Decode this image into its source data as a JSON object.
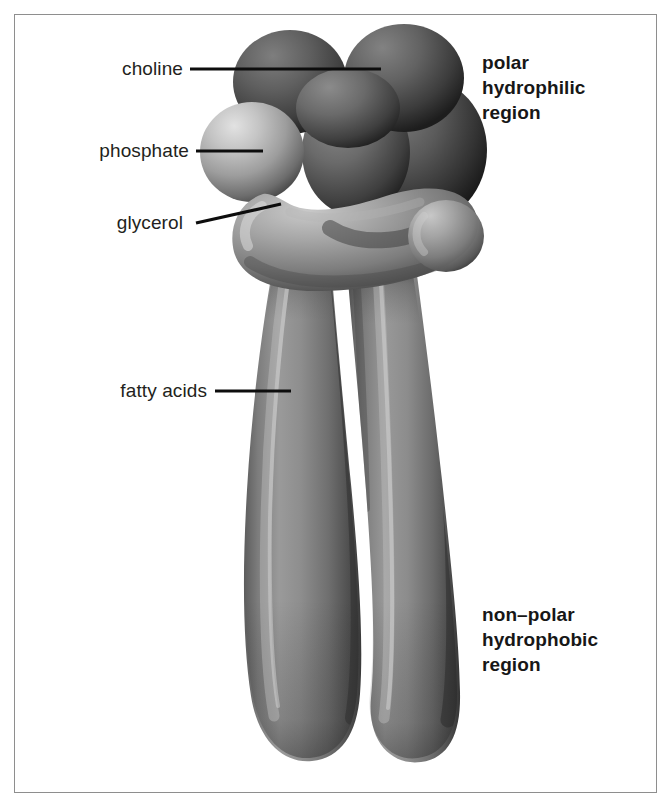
{
  "figure": {
    "background_color": "#ffffff",
    "frame_color": "#8e8e8e",
    "leader_line_color": "#0d0d0d"
  },
  "labels": {
    "choline": "choline",
    "phosphate": "phosphate",
    "glycerol": "glycerol",
    "fatty_acids": "fatty acids"
  },
  "regions": {
    "polar": {
      "line1": "polar",
      "line2": "hydrophilic",
      "line3": "region"
    },
    "nonpolar": {
      "line1": "non–polar",
      "line2": "hydrophobic",
      "line3": "region"
    }
  },
  "molecule": {
    "head_dark_color": "#545454",
    "phosphate_color": "#a9a9a9",
    "glycerol_color": "#8b8b8b",
    "tail_color": "#858585",
    "tail_shadow_color": "#4b4b4b"
  }
}
